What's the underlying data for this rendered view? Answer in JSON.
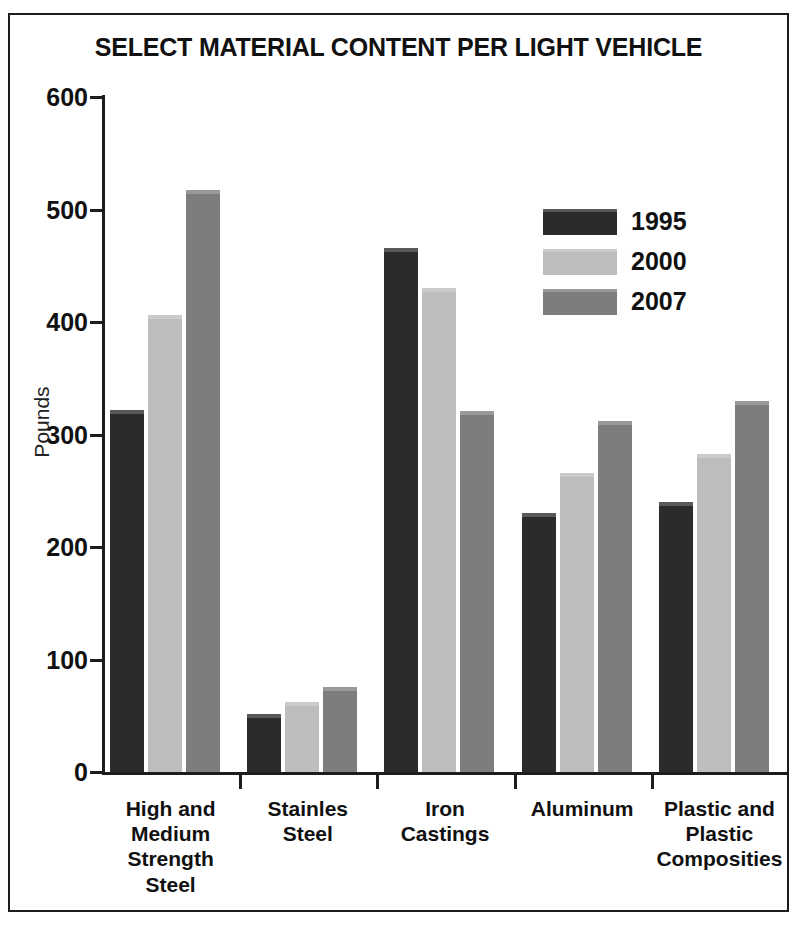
{
  "chart_data": {
    "type": "bar",
    "title": "SELECT MATERIAL CONTENT PER LIGHT VEHICLE",
    "xlabel": "",
    "ylabel": "Pounds",
    "ylim": [
      0,
      600
    ],
    "yticks": [
      0,
      100,
      200,
      300,
      400,
      500,
      600
    ],
    "ytick_labels": [
      "0",
      "100",
      "200",
      "300",
      "400",
      "500",
      "600"
    ],
    "grid": false,
    "legend_position": "inside-upper-right",
    "categories": [
      "High and Medium Strength Steel",
      "Stainles Steel",
      "Iron Castings",
      "Aluminum",
      "Plastic and Plastic Composities"
    ],
    "category_lines": [
      [
        "High and",
        "Medium",
        "Strength",
        "Steel"
      ],
      [
        "Stainles",
        "Steel"
      ],
      [
        "Iron",
        "Castings"
      ],
      [
        "Aluminum"
      ],
      [
        "Plastic and",
        "Plastic",
        "Composities"
      ]
    ],
    "series": [
      {
        "name": "1995",
        "color": "#2b2b2b",
        "values": [
          322,
          52,
          466,
          230,
          240
        ]
      },
      {
        "name": "2000",
        "color": "#bdbdbd",
        "values": [
          406,
          62,
          430,
          266,
          283
        ]
      },
      {
        "name": "2007",
        "color": "#7d7d7d",
        "values": [
          517,
          76,
          321,
          312,
          330
        ]
      }
    ]
  },
  "legend": {
    "items": [
      {
        "label": "1995",
        "color": "#2b2b2b"
      },
      {
        "label": "2000",
        "color": "#bdbdbd"
      },
      {
        "label": "2007",
        "color": "#7d7d7d"
      }
    ]
  },
  "axis": {
    "y_title": "Pounds",
    "y_labels": [
      "600",
      "500",
      "400",
      "300",
      "200",
      "100",
      "0"
    ]
  },
  "colors": {
    "series_1995": "#2b2b2b",
    "series_2000": "#bdbdbd",
    "series_2007": "#7d7d7d",
    "frame": "#1d1d1d",
    "text": "#111111",
    "background": "#ffffff"
  }
}
